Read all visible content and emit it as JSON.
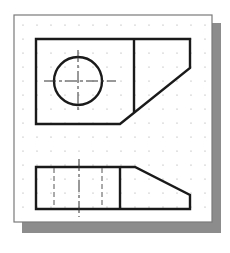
{
  "drawing": {
    "type": "orthographic-projection",
    "views": [
      "top-view",
      "front-view"
    ],
    "colors": {
      "background": "#ffffff",
      "paper": "#ffffff",
      "paper_border": "#7a7a7a",
      "shadow": "#8c8c8c",
      "object_line": "#1a1a1a",
      "hidden_line": "#555555",
      "center_line": "#333333",
      "grid_dot": "#9a9a9a"
    },
    "grid": {
      "spacing": 14,
      "dot_radius": 0.6
    }
  }
}
